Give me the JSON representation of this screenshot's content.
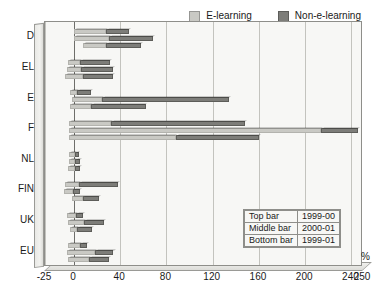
{
  "chart_data": {
    "type": "bar",
    "orientation": "horizontal",
    "stacked": true,
    "title": "",
    "xlabel": "%",
    "ylabel": "",
    "xlim": [
      -25,
      250
    ],
    "xticks": [
      -25,
      0,
      40,
      80,
      120,
      160,
      200,
      240,
      250
    ],
    "xticklabels": [
      "-25",
      "0",
      "40",
      "80",
      "120",
      "160",
      "200",
      "240",
      "250"
    ],
    "grid": true,
    "legend_position": "top-right",
    "categories": [
      "D",
      "EL",
      "E",
      "F",
      "NL",
      "FIN",
      "UK",
      "EU"
    ],
    "series": [
      {
        "name": "E-learning",
        "color": "#c9c9c4"
      },
      {
        "name": "Non-e-learning",
        "color": "#7d7d79"
      }
    ],
    "bar_groups": [
      {
        "label": "Top bar",
        "period": "1999-00"
      },
      {
        "label": "Middle bar",
        "period": "2000-01"
      },
      {
        "label": "Bottom bar",
        "period": "1999-01"
      }
    ],
    "values": {
      "D": {
        "1999-00": {
          "start": 0,
          "e_learning": 28,
          "non_e_learning": 20
        },
        "2000-01": {
          "start": 0,
          "e_learning": 30,
          "non_e_learning": 38
        },
        "1999-01": {
          "start": 8,
          "e_learning": 20,
          "non_e_learning": 30
        }
      },
      "EL": {
        "1999-00": {
          "start": -5,
          "e_learning": 10,
          "non_e_learning": 26
        },
        "2000-01": {
          "start": -6,
          "e_learning": 12,
          "non_e_learning": 28
        },
        "1999-01": {
          "start": -8,
          "e_learning": 16,
          "non_e_learning": 26
        }
      },
      "E": {
        "1999-00": {
          "start": -3,
          "e_learning": 6,
          "non_e_learning": 12
        },
        "2000-01": {
          "start": -2,
          "e_learning": 26,
          "non_e_learning": 110
        },
        "1999-01": {
          "start": -3,
          "e_learning": 18,
          "non_e_learning": 47
        }
      },
      "F": {
        "1999-00": {
          "start": -4,
          "e_learning": 36,
          "non_e_learning": 116
        },
        "2000-01": {
          "start": -4,
          "e_learning": 218,
          "non_e_learning": 32
        },
        "1999-01": {
          "start": -4,
          "e_learning": 92,
          "non_e_learning": 72
        }
      },
      "NL": {
        "1999-00": {
          "start": -4,
          "e_learning": 5,
          "non_e_learning": 3
        },
        "2000-01": {
          "start": -4,
          "e_learning": 5,
          "non_e_learning": 4
        },
        "1999-01": {
          "start": -5,
          "e_learning": 6,
          "non_e_learning": 4
        }
      },
      "FIN": {
        "1999-00": {
          "start": -8,
          "e_learning": 12,
          "non_e_learning": 34
        },
        "2000-01": {
          "start": -9,
          "e_learning": 8,
          "non_e_learning": 6
        },
        "1999-01": {
          "start": -2,
          "e_learning": 10,
          "non_e_learning": 14
        }
      },
      "UK": {
        "1999-00": {
          "start": -6,
          "e_learning": 8,
          "non_e_learning": 6
        },
        "2000-01": {
          "start": -5,
          "e_learning": 14,
          "non_e_learning": 17
        },
        "1999-01": {
          "start": -3,
          "e_learning": 6,
          "non_e_learning": 13
        }
      },
      "EU": {
        "1999-00": {
          "start": -5,
          "e_learning": 10,
          "non_e_learning": 6
        },
        "2000-01": {
          "start": -6,
          "e_learning": 24,
          "non_e_learning": 16
        },
        "1999-01": {
          "start": -5,
          "e_learning": 18,
          "non_e_learning": 17
        }
      }
    }
  },
  "legend": {
    "entries": [
      {
        "label": "E-learning",
        "color": "#c9c9c4"
      },
      {
        "label": "Non-e-learning",
        "color": "#7d7d79"
      }
    ]
  },
  "note_table": {
    "rows": [
      {
        "bar": "Top bar",
        "period": "1999-00"
      },
      {
        "bar": "Middle bar",
        "period": "2000-01"
      },
      {
        "bar": "Bottom bar",
        "period": "1999-01"
      }
    ]
  },
  "axis": {
    "unit_label": "%"
  }
}
